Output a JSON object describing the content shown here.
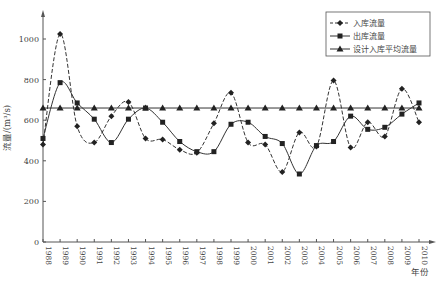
{
  "chart_data": {
    "type": "line",
    "title": "",
    "xlabel": "年份",
    "ylabel": "流量/(m³/s)",
    "ylim": [
      0,
      1100
    ],
    "yticks": [
      0,
      200,
      400,
      600,
      800,
      1000
    ],
    "grid": false,
    "legend_position": "top-right",
    "x": [
      1988,
      1989,
      1990,
      1991,
      1992,
      1993,
      1994,
      1995,
      1996,
      1997,
      1998,
      1999,
      2000,
      2001,
      2002,
      2003,
      2004,
      2005,
      2006,
      2007,
      2008,
      2009,
      2010
    ],
    "series": [
      {
        "name": "入库流量",
        "style": "dashed",
        "marker": "diamond",
        "values": [
          480,
          1025,
          570,
          490,
          620,
          690,
          510,
          505,
          455,
          440,
          585,
          735,
          490,
          480,
          345,
          540,
          470,
          795,
          465,
          590,
          520,
          755,
          590
        ]
      },
      {
        "name": "出库流量",
        "style": "solid",
        "marker": "square",
        "values": [
          510,
          785,
          685,
          605,
          490,
          605,
          660,
          590,
          495,
          445,
          445,
          580,
          590,
          520,
          485,
          335,
          475,
          495,
          620,
          555,
          565,
          630,
          685
        ]
      },
      {
        "name": "设计入库平均流量",
        "style": "solid",
        "marker": "triangle",
        "values": [
          660,
          660,
          660,
          660,
          660,
          660,
          660,
          660,
          660,
          660,
          660,
          660,
          660,
          660,
          660,
          660,
          660,
          660,
          660,
          660,
          660,
          660,
          660
        ]
      }
    ]
  }
}
